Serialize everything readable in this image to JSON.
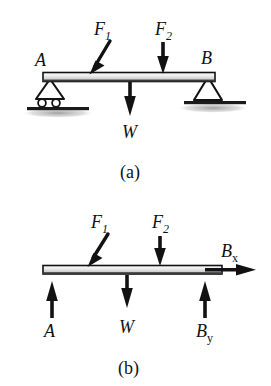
{
  "figure": {
    "panels": [
      {
        "id": "a",
        "caption": "(a)",
        "description": "Simply supported beam with roller support at A and pin support at B",
        "beam": {
          "x1": 43,
          "x2": 215,
          "y": 77,
          "thickness": 9
        },
        "labels": {
          "support_left": "A",
          "support_right": "B",
          "force_1": "F",
          "force_1_sub": "1",
          "force_2": "F",
          "force_2_sub": "2",
          "weight": "W"
        },
        "supports": [
          {
            "name": "roller-support-a",
            "type": "roller",
            "x": 50,
            "label": "A"
          },
          {
            "name": "pin-support-b",
            "type": "pin",
            "x": 208,
            "label": "B"
          }
        ],
        "forces": [
          {
            "name": "F1",
            "type": "applied",
            "direction": "down-left-diagonal",
            "x": 95,
            "label": "F",
            "sub": "1"
          },
          {
            "name": "F2",
            "type": "applied",
            "direction": "down",
            "x": 163,
            "label": "F",
            "sub": "2"
          },
          {
            "name": "W",
            "type": "weight",
            "direction": "down",
            "x": 130,
            "label": "W",
            "sub": ""
          }
        ]
      },
      {
        "id": "b",
        "caption": "(b)",
        "description": "Free-body diagram of the beam showing reaction forces A, Bx and By",
        "beam": {
          "x1": 43,
          "x2": 222,
          "y": 270,
          "thickness": 8
        },
        "labels": {
          "reaction_a": "A",
          "reaction_bx": "B",
          "reaction_bx_sub": "x",
          "reaction_by": "B",
          "reaction_by_sub": "y",
          "force_1": "F",
          "force_1_sub": "1",
          "force_2": "F",
          "force_2_sub": "2",
          "weight": "W"
        },
        "forces": [
          {
            "name": "F1",
            "type": "applied",
            "direction": "down-left-diagonal",
            "x": 93,
            "label": "F",
            "sub": "1"
          },
          {
            "name": "F2",
            "type": "applied",
            "direction": "down",
            "x": 160,
            "label": "F",
            "sub": "2"
          },
          {
            "name": "W",
            "type": "weight",
            "direction": "down",
            "x": 127,
            "label": "W",
            "sub": ""
          },
          {
            "name": "A",
            "type": "reaction",
            "direction": "up",
            "x": 52,
            "label": "A",
            "sub": ""
          },
          {
            "name": "Bx",
            "type": "reaction",
            "direction": "right",
            "x": 222,
            "label": "B",
            "sub": "x"
          },
          {
            "name": "By",
            "type": "reaction",
            "direction": "up",
            "x": 205,
            "label": "B",
            "sub": "y"
          }
        ]
      }
    ],
    "colors": {
      "ink": "#111111",
      "beam_top": "#f2f2f2",
      "beam_mid": "#d9d9d9",
      "beam_bottom": "#b8b8b8",
      "ground_shadow": "#8a8a8a",
      "background": "#ffffff"
    }
  }
}
